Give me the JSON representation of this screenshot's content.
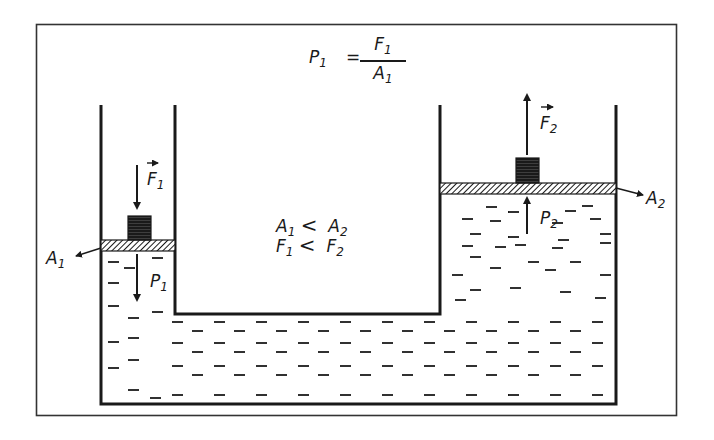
{
  "figure": {
    "title_formula": {
      "lhs": "P",
      "lhs_sub": "1",
      "equals": "=",
      "numerator": "F",
      "numerator_sub": "1",
      "denominator": "A",
      "denominator_sub": "1"
    },
    "relations": [
      {
        "left": "A",
        "left_sub": "1",
        "op": "<",
        "right": "A",
        "right_sub": "2"
      },
      {
        "left": "F",
        "left_sub": "1",
        "op": "<",
        "right": "F",
        "right_sub": "2"
      }
    ],
    "left_piston": {
      "force_label": "F",
      "force_sub": "1",
      "force_direction": "down",
      "pressure_label": "P",
      "pressure_sub": "1",
      "area_label": "A",
      "area_sub": "1"
    },
    "right_piston": {
      "force_label": "F",
      "force_sub": "2",
      "force_direction": "up",
      "pressure_label": "P",
      "pressure_sub": "2",
      "area_label": "A",
      "area_sub": "2"
    },
    "colors": {
      "line": "#1a1a1a",
      "background": "#ffffff",
      "frame": "#333333"
    }
  }
}
